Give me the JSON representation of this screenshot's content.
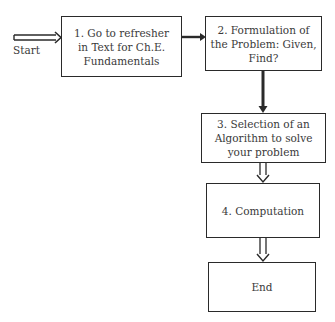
{
  "flowchart": {
    "start_label": "Start",
    "steps": [
      {
        "id": 1,
        "text": "1. Go to refresher in Text for Ch.E. Fundamentals"
      },
      {
        "id": 2,
        "text": "2. Formulation of the Problem: Given, Find?"
      },
      {
        "id": 3,
        "text": "3. Selection of an Algorithm to solve your problem"
      },
      {
        "id": 4,
        "text": "4. Computation"
      },
      {
        "id": 5,
        "text": "End"
      }
    ],
    "colors": {
      "line": "#2a2a2a",
      "text": "#3a3a3a",
      "background": "#ffffff"
    }
  }
}
